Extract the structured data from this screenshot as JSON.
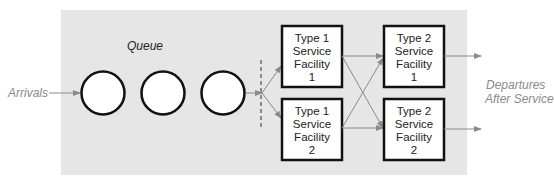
{
  "diagram": {
    "queue_label": "Queue",
    "arrivals_label": "Arrivals",
    "departures_label_line1": "Departures",
    "departures_label_line2": "After Service",
    "colors": {
      "background_panel": "#e6e6e6",
      "box_stroke": "#111111",
      "arrow": "#8a8a8a",
      "gray_text": "#8a8a8a",
      "dark_text": "#222222"
    },
    "queue_slots": 3,
    "type1": [
      {
        "line1": "Type 1",
        "line2": "Service",
        "line3": "Facility",
        "line4": "1"
      },
      {
        "line1": "Type 1",
        "line2": "Service",
        "line3": "Facility",
        "line4": "2"
      }
    ],
    "type2": [
      {
        "line1": "Type 2",
        "line2": "Service",
        "line3": "Facility",
        "line4": "1"
      },
      {
        "line1": "Type 2",
        "line2": "Service",
        "line3": "Facility",
        "line4": "2"
      }
    ]
  }
}
